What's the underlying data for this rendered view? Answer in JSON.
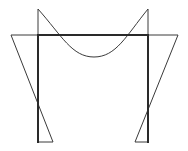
{
  "diagram": {
    "type": "portal-frame-bending-moment-diagram",
    "colors": {
      "background": "#ffffff",
      "frame": "#2a2a2a",
      "moment": "#3a3a3a"
    },
    "frame": {
      "left_column": {
        "x": 38,
        "top": 35,
        "bottom": 142
      },
      "right_column": {
        "x": 148,
        "top": 35,
        "bottom": 142
      },
      "beam": {
        "y": 35,
        "x1": 38,
        "x2": 148
      }
    },
    "moment_diagram": {
      "left_column_triangle": {
        "top_offset_point": [
          11,
          35
        ],
        "base_offset_point": [
          53,
          142
        ]
      },
      "right_column_triangle": {
        "top_offset_point": [
          178,
          35
        ],
        "base_offset_point": [
          135,
          142
        ]
      },
      "beam_curve": {
        "left_apex": [
          38,
          9
        ],
        "sagging_min": [
          94,
          57
        ],
        "right_apex": [
          148,
          9
        ]
      }
    }
  }
}
